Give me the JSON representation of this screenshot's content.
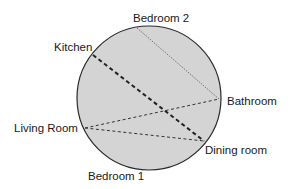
{
  "diagram": {
    "shape": "circle",
    "fill": "#d4d4d4",
    "stroke": "#2a2a2a",
    "labels": {
      "bedroom2": "Bedroom 2",
      "kitchen": "Kitchen",
      "bathroom": "Bathroom",
      "living_room": "Living Room",
      "dining_room": "Dining room",
      "bedroom1": "Bedroom 1"
    },
    "connections": [
      {
        "from": "Bedroom 2",
        "to": "Bathroom",
        "style": "dotted"
      },
      {
        "from": "Kitchen",
        "to": "Dining room",
        "style": "heavy-dashed"
      },
      {
        "from": "Living Room",
        "to": "Bathroom",
        "style": "dashed"
      },
      {
        "from": "Living Room",
        "to": "Dining room",
        "style": "dashed"
      }
    ]
  }
}
